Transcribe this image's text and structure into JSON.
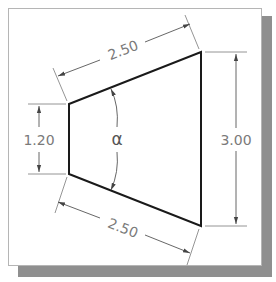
{
  "figure": {
    "type": "dimensioned-trapezoid-drawing",
    "colors": {
      "object_line": "#1a1a1a",
      "dimension_line": "#6e6e6e",
      "dimension_text": "#7a7a7a",
      "frame_shadow": "#8f8f8f",
      "frame_border": "#b5b5b5",
      "background": "#ffffff"
    }
  },
  "dimensions": {
    "top_edge": {
      "label": "2.50"
    },
    "bottom_edge": {
      "label": "2.50"
    },
    "left_height": {
      "label": "1.20"
    },
    "right_height": {
      "label": "3.00"
    },
    "angle": {
      "label": "α"
    }
  }
}
